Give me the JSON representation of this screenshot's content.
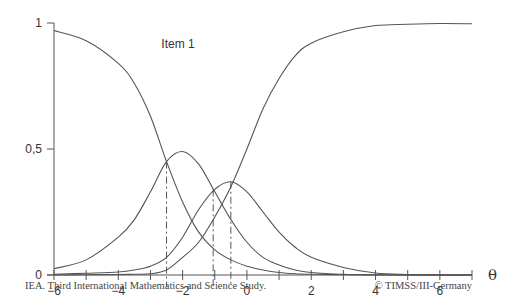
{
  "chart_data": {
    "type": "line",
    "title": "Item 1",
    "xlabel": "θ",
    "ylabel": "",
    "xlim": [
      -6,
      7
    ],
    "ylim": [
      0,
      1
    ],
    "grid": false,
    "legend": null,
    "x_ticks": [
      -6,
      -5,
      -4,
      -3,
      -2,
      -1,
      0,
      1,
      2,
      3,
      4,
      5,
      6,
      7
    ],
    "x_tick_labels": [
      {
        "value": -6,
        "label": "−6"
      },
      {
        "value": -4,
        "label": "−4"
      },
      {
        "value": -2,
        "label": "−2"
      },
      {
        "value": 0,
        "label": "0"
      },
      {
        "value": 2,
        "label": "2"
      },
      {
        "value": 4,
        "label": "4"
      },
      {
        "value": 6,
        "label": "6"
      }
    ],
    "y_tick_labels": [
      {
        "value": 0,
        "label": "0"
      },
      {
        "value": 0.5,
        "label": "0,5"
      },
      {
        "value": 1,
        "label": "1"
      }
    ],
    "x": [
      -6,
      -5,
      -4,
      -3.5,
      -3,
      -2.5,
      -2,
      -1.5,
      -1,
      -0.5,
      0,
      0.5,
      1,
      1.5,
      2,
      3,
      4,
      5,
      6,
      7
    ],
    "series": [
      {
        "name": "Category 0",
        "values": [
          0.97,
          0.93,
          0.84,
          0.76,
          0.63,
          0.45,
          0.29,
          0.17,
          0.1,
          0.06,
          0.035,
          0.02,
          0.01,
          0.005,
          0.003,
          0.001,
          0.0,
          0.0,
          0.0,
          0.0
        ]
      },
      {
        "name": "Category 1",
        "values": [
          0.025,
          0.06,
          0.15,
          0.22,
          0.33,
          0.45,
          0.49,
          0.44,
          0.33,
          0.22,
          0.13,
          0.07,
          0.04,
          0.02,
          0.01,
          0.003,
          0.001,
          0.0,
          0.0,
          0.0
        ]
      },
      {
        "name": "Category 2",
        "values": [
          0.003,
          0.007,
          0.012,
          0.02,
          0.035,
          0.07,
          0.15,
          0.26,
          0.34,
          0.37,
          0.33,
          0.25,
          0.17,
          0.11,
          0.07,
          0.03,
          0.008,
          0.002,
          0.0,
          0.0
        ]
      },
      {
        "name": "Category 3",
        "values": [
          0.0,
          0.001,
          0.002,
          0.003,
          0.005,
          0.02,
          0.07,
          0.13,
          0.23,
          0.35,
          0.5,
          0.66,
          0.78,
          0.87,
          0.92,
          0.965,
          0.99,
          0.995,
          0.998,
          0.997
        ]
      }
    ],
    "annotations": [
      {
        "type": "vline",
        "x": -2.5,
        "y_top": 0.45,
        "style": "dash-dot",
        "label": ""
      },
      {
        "type": "vline",
        "x": -1.05,
        "y_top": 0.34,
        "style": "dash-dot",
        "label": ""
      },
      {
        "type": "vline",
        "x": -0.5,
        "y_top": 0.37,
        "style": "dash-dot",
        "label": ""
      }
    ],
    "line_color": "#555555"
  },
  "footer": {
    "left": "IEA. Third International Mathematics and Science Study.",
    "right": "© TIMSS/III-Germany"
  }
}
